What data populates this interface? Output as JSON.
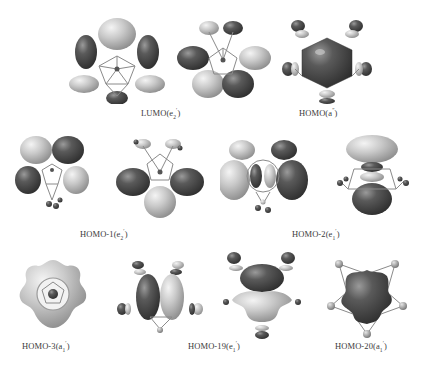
{
  "figure": {
    "panels": [
      {
        "id": "lumo",
        "label_prefix": "LUMO(",
        "irrep": "e",
        "sub": "2",
        "sup": "′",
        "label_suffix": ")"
      },
      {
        "id": "homo",
        "label_prefix": "HOMO(",
        "irrep": "a",
        "sub": "",
        "sup": "″",
        "label_suffix": ")"
      },
      {
        "id": "homo-1",
        "label_prefix": "HOMO-1(",
        "irrep": "e",
        "sub": "2",
        "sup": "′",
        "label_suffix": ")"
      },
      {
        "id": "homo-2",
        "label_prefix": "HOMO-2(",
        "irrep": "e",
        "sub": "1",
        "sup": "′",
        "label_suffix": ")"
      },
      {
        "id": "homo-3",
        "label_prefix": "HOMO-3(",
        "irrep": "a",
        "sub": "1",
        "sup": "′",
        "label_suffix": ")"
      },
      {
        "id": "homo-19",
        "label_prefix": "HOMO-19(",
        "irrep": "e",
        "sub": "1",
        "sup": "′",
        "label_suffix": ")"
      },
      {
        "id": "homo-20",
        "label_prefix": "HOMO-20(",
        "irrep": "a",
        "sub": "1",
        "sup": "′",
        "label_suffix": ")"
      }
    ],
    "colors": {
      "lobe_dark": "#4a4a4a",
      "lobe_light": "#c8c8c8",
      "bond": "#8a8a8a",
      "text": "#3a3a3a"
    }
  }
}
